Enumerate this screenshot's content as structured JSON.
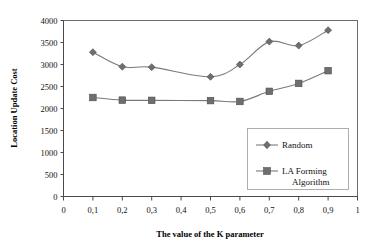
{
  "chart_data": {
    "type": "line",
    "title": "",
    "xlabel": "The value of the K parameter",
    "ylabel": "Location Update Cost",
    "xlim": [
      0,
      1
    ],
    "ylim": [
      0,
      4000
    ],
    "grid": false,
    "legend_position": "center-right",
    "x_tick_labels": [
      "0",
      "0,1",
      "0,2",
      "0,3",
      "0,4",
      "0,5",
      "0,6",
      "0,7",
      "0,8",
      "0,9",
      "1"
    ],
    "x_tick_values": [
      0,
      0.1,
      0.2,
      0.3,
      0.4,
      0.5,
      0.6,
      0.7,
      0.8,
      0.9,
      1
    ],
    "y_tick_labels": [
      "0",
      "500",
      "1000",
      "1500",
      "2000",
      "2500",
      "3000",
      "3500",
      "4000"
    ],
    "y_tick_values": [
      0,
      500,
      1000,
      1500,
      2000,
      2500,
      3000,
      3500,
      4000
    ],
    "x": [
      0.1,
      0.2,
      0.3,
      0.5,
      0.6,
      0.7,
      0.8,
      0.9
    ],
    "series": [
      {
        "name": "Random",
        "marker": "diamond",
        "x": [
          0.1,
          0.2,
          0.3,
          0.5,
          0.6,
          0.7,
          0.8,
          0.9
        ],
        "values": [
          3280,
          2950,
          2940,
          2720,
          3000,
          3520,
          3430,
          3780
        ]
      },
      {
        "name": "LA Forming Algorithm",
        "marker": "square",
        "x": [
          0.1,
          0.2,
          0.3,
          0.5,
          0.6,
          0.7,
          0.8,
          0.9
        ],
        "values": [
          2250,
          2190,
          2185,
          2180,
          2160,
          2390,
          2570,
          2860
        ]
      }
    ]
  },
  "legend": {
    "entries": [
      {
        "label": "Random",
        "marker": "diamond"
      },
      {
        "label_line1": "LA Forming",
        "label_line2": "Algorithm",
        "marker": "square"
      }
    ]
  },
  "colors": {
    "series_line": "#7a7a7a",
    "marker_fill": "#6e6e6e",
    "axis": "#4a4a4a",
    "frame": "#6b6b6b",
    "background": "#ffffff",
    "text": "#111111"
  }
}
